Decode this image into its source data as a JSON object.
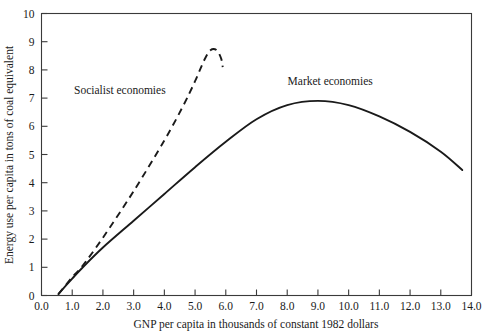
{
  "chart_data": {
    "type": "line",
    "title": "",
    "xlabel": "GNP per capita in thousands of constant 1982 dollars",
    "ylabel": "Energy use per capita in tons of coal equivalent",
    "xlim": [
      0.0,
      14.0
    ],
    "ylim": [
      0,
      10
    ],
    "grid": false,
    "legend_position": "inline-annotations",
    "xticks": [
      "0.0",
      "1.0",
      "2.0",
      "3.0",
      "4.0",
      "5.0",
      "6.0",
      "7.0",
      "8.0",
      "9.0",
      "10.0",
      "11.0",
      "12.0",
      "13.0",
      "14.0"
    ],
    "xtick_values": [
      0.0,
      1.0,
      2.0,
      3.0,
      4.0,
      5.0,
      6.0,
      7.0,
      8.0,
      9.0,
      10.0,
      11.0,
      12.0,
      13.0,
      14.0
    ],
    "yticks": [
      "0",
      "1",
      "2",
      "3",
      "4",
      "5",
      "6",
      "7",
      "8",
      "9",
      "10"
    ],
    "ytick_values": [
      0,
      1,
      2,
      3,
      4,
      5,
      6,
      7,
      8,
      9,
      10
    ],
    "series": [
      {
        "name": "Socialist economies",
        "style": "dashed",
        "color": "#1a1a1a",
        "points": [
          [
            0.55,
            0.05
          ],
          [
            1.0,
            0.65
          ],
          [
            1.3,
            1.0
          ],
          [
            2.0,
            2.05
          ],
          [
            3.0,
            3.7
          ],
          [
            4.0,
            5.5
          ],
          [
            4.6,
            6.7
          ],
          [
            5.0,
            7.6
          ],
          [
            5.3,
            8.35
          ],
          [
            5.5,
            8.7
          ],
          [
            5.7,
            8.7
          ],
          [
            5.85,
            8.4
          ],
          [
            5.9,
            8.1
          ]
        ]
      },
      {
        "name": "Market economies",
        "style": "solid",
        "color": "#1a1a1a",
        "points": [
          [
            0.55,
            0.05
          ],
          [
            1.0,
            0.6
          ],
          [
            1.3,
            0.95
          ],
          [
            2.0,
            1.7
          ],
          [
            3.0,
            2.65
          ],
          [
            4.0,
            3.6
          ],
          [
            5.0,
            4.55
          ],
          [
            6.0,
            5.45
          ],
          [
            7.0,
            6.25
          ],
          [
            8.0,
            6.75
          ],
          [
            9.0,
            6.9
          ],
          [
            10.0,
            6.75
          ],
          [
            11.0,
            6.35
          ],
          [
            12.0,
            5.8
          ],
          [
            13.0,
            5.1
          ],
          [
            13.7,
            4.45
          ]
        ]
      }
    ],
    "annotations": [
      {
        "text": "Socialist economies",
        "x": 2.55,
        "y": 7.15,
        "anchor": "middle"
      },
      {
        "text": "Market economies",
        "x": 9.4,
        "y": 7.45,
        "anchor": "middle"
      }
    ]
  }
}
